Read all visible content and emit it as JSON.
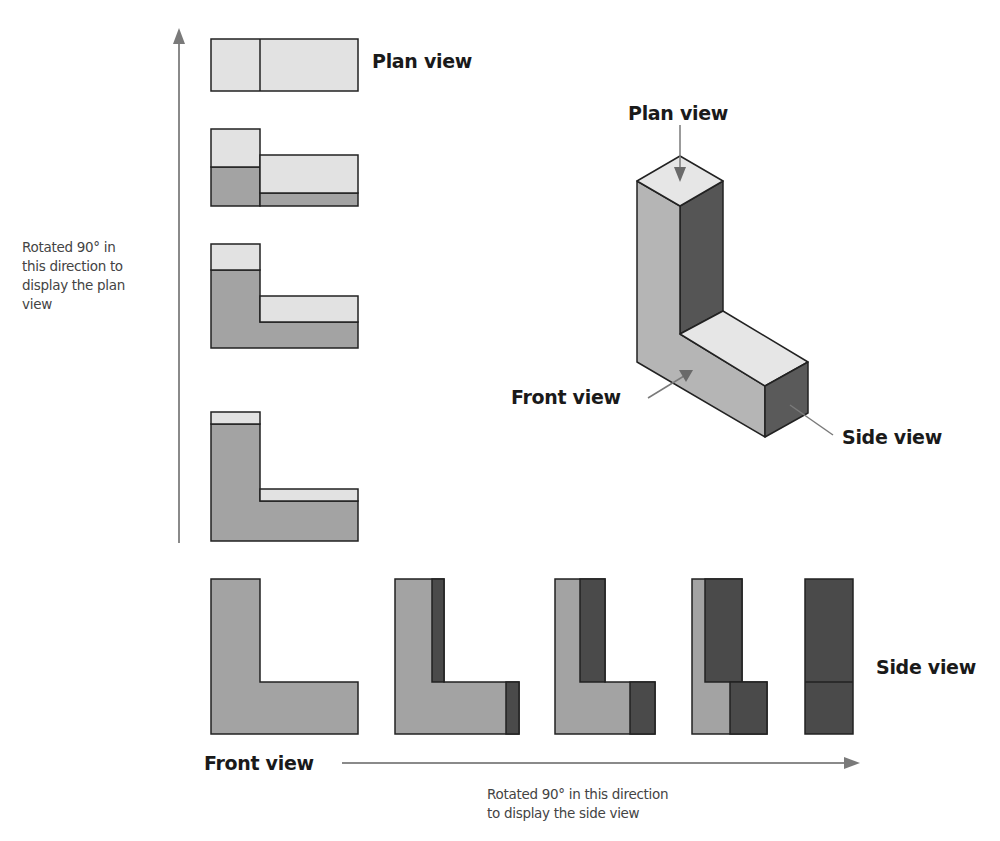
{
  "colors": {
    "light": "#e2e2e2",
    "mid": "#a3a3a3",
    "dark": "#4a4a4a",
    "stroke": "#222222",
    "arrow": "#7a7a7a"
  },
  "labels": {
    "plan_view_top": "Plan view",
    "plan_view_iso": "Plan view",
    "front_view_iso": "Front view",
    "side_view_iso": "Side view",
    "side_view_bottom": "Side view",
    "front_view_bottom": "Front view",
    "rotate_plan": [
      "Rotated 90° in",
      "this direction to",
      "display the plan",
      "view"
    ],
    "rotate_side": [
      "Rotated 90° in this direction",
      "to display the side view"
    ]
  },
  "vertical_sequence": [
    {
      "name": "plan-view-step-4",
      "desc": "Plan view (top)"
    },
    {
      "name": "plan-rotation-step-3"
    },
    {
      "name": "plan-rotation-step-2"
    },
    {
      "name": "plan-rotation-step-1"
    }
  ],
  "horizontal_sequence": [
    {
      "name": "front-view"
    },
    {
      "name": "side-rotation-step-1"
    },
    {
      "name": "side-rotation-step-2"
    },
    {
      "name": "side-rotation-step-3"
    },
    {
      "name": "side-view"
    }
  ]
}
